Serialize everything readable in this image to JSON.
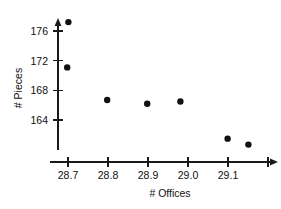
{
  "chart_data": {
    "type": "scatter",
    "title": "",
    "xlabel": "# Offices",
    "ylabel": "# Pieces",
    "xlim": [
      28.65,
      29.25
    ],
    "ylim": [
      159.5,
      178.5
    ],
    "grid": false,
    "legend": null,
    "x_ticks": [
      {
        "value": 28.7,
        "label": "28.7"
      },
      {
        "value": 28.8,
        "label": "28.8"
      },
      {
        "value": 28.9,
        "label": "28.9"
      },
      {
        "value": 29.0,
        "label": "29.0"
      },
      {
        "value": 29.1,
        "label": "29.1"
      },
      {
        "value": 29.2,
        "label": ""
      }
    ],
    "y_ticks": [
      {
        "value": 164,
        "label": "164"
      },
      {
        "value": 168,
        "label": "168"
      },
      {
        "value": 172,
        "label": "172"
      },
      {
        "value": 176,
        "label": "176"
      }
    ],
    "x": [
      28.701,
      28.698,
      28.798,
      28.898,
      28.981,
      29.099,
      29.151
    ],
    "y": [
      177.2,
      171.1,
      166.7,
      166.2,
      166.5,
      161.5,
      160.7
    ],
    "points": [
      {
        "x": 28.701,
        "y": 177.2
      },
      {
        "x": 28.698,
        "y": 171.1
      },
      {
        "x": 28.798,
        "y": 166.7
      },
      {
        "x": 28.898,
        "y": 166.2
      },
      {
        "x": 28.981,
        "y": 166.5
      },
      {
        "x": 29.099,
        "y": 161.5
      },
      {
        "x": 29.151,
        "y": 160.7
      }
    ],
    "marker": {
      "shape": "circle",
      "color": "#111111",
      "size": 3.2
    },
    "axis_color": "#1a1a1a"
  }
}
